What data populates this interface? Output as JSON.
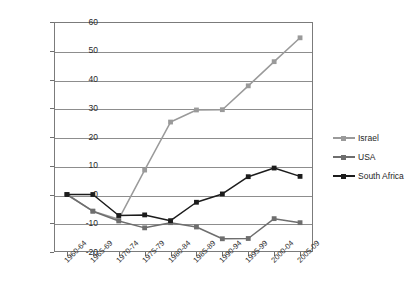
{
  "chart_data": {
    "type": "line",
    "title": "",
    "subtitle": "",
    "xlabel": "",
    "ylabel": "",
    "categories": [
      "1960-64",
      "1965-69",
      "1970-74",
      "1975-79",
      "1980-84",
      "1985-89",
      "1990-94",
      "1995-99",
      "2000-04",
      "2005-09"
    ],
    "ylim": [
      -20,
      60
    ],
    "yticks": [
      60,
      50,
      40,
      30,
      20,
      10,
      0,
      -10,
      -20
    ],
    "ytick_labels": [
      "60",
      "50",
      "40",
      "30",
      "20",
      "10",
      "0",
      "-10",
      "-20"
    ],
    "grid": true,
    "legend_position": "right",
    "series": [
      {
        "name": "Israel",
        "color": "#9a9a9a",
        "marker": "square",
        "values": [
          0,
          -5.8,
          -8.6,
          8.5,
          25.2,
          29.4,
          29.5,
          37.8,
          46.2,
          54.5
        ]
      },
      {
        "name": "USA",
        "color": "#6e6e6e",
        "marker": "square",
        "values": [
          0,
          -5.8,
          -9.2,
          -11.6,
          -9.8,
          -11.3,
          -15.4,
          -15.3,
          -8.4,
          -9.8
        ]
      },
      {
        "name": "South Africa",
        "color": "#1c1c1c",
        "marker": "square",
        "values": [
          0,
          0,
          -7.3,
          -7.1,
          -9.1,
          -2.7,
          0.2,
          6.2,
          9.2,
          6.3
        ]
      }
    ]
  },
  "legend": {
    "items": [
      {
        "label": "Israel"
      },
      {
        "label": "USA"
      },
      {
        "label": "South Africa"
      }
    ]
  },
  "colors": {
    "israel": "#9a9a9a",
    "usa": "#6e6e6e",
    "south_africa": "#1c1c1c",
    "gridline": "#8d8d8d",
    "axis": "#7b7b7b",
    "text": "#2a2a2a",
    "background": "#ffffff"
  }
}
